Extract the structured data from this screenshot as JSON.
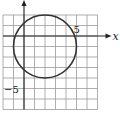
{
  "chart_data": {
    "type": "line",
    "title": "",
    "shape": "circle",
    "center": [
      2,
      -1
    ],
    "radius": 3,
    "equation": "(x-2)^2 + (y+1)^2 = 9",
    "xlabel": "x",
    "ylabel": "y",
    "xlim": [
      -2,
      7
    ],
    "ylim": [
      -7,
      2
    ],
    "x_tick_labels": [
      {
        "value": 5,
        "label": "5"
      }
    ],
    "y_tick_labels": [
      {
        "value": -5,
        "label": "-5"
      }
    ],
    "grid": true,
    "grid_step": 1
  },
  "labels": {
    "x_axis": "x",
    "y_axis": "y",
    "x_tick": "5",
    "y_tick": "−5"
  },
  "colors": {
    "grid": "#9a9a9a",
    "axis": "#222222",
    "circle": "#333333"
  }
}
